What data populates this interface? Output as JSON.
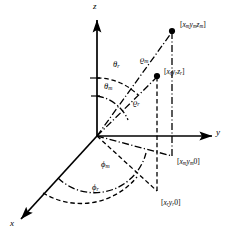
{
  "figure": {
    "background_color": "#ffffff",
    "stroke_color": "#000000"
  },
  "axes": [
    {
      "name": "z-axis",
      "label": "z",
      "direction": "up"
    },
    {
      "name": "y-axis",
      "label": "y",
      "direction": "right"
    },
    {
      "name": "x-axis",
      "label": "x",
      "direction": "down-left"
    }
  ],
  "axis_labels": {
    "z": "z",
    "y": "y",
    "x": "x"
  },
  "points": [
    {
      "id": "point-m",
      "label_prefix": "[",
      "label": "[xₘyₘzₘ]",
      "coords": [
        "x",
        "y",
        "z"
      ],
      "subscript": "m"
    },
    {
      "id": "point-r",
      "label": "[xᵣyᵣzᵣ]",
      "coords": [
        "x",
        "y",
        "z"
      ],
      "subscript": "r"
    },
    {
      "id": "projection-m",
      "label": "[xₘyₘ 0]",
      "coords": [
        "x",
        "y",
        "0"
      ],
      "subscript": "m"
    },
    {
      "id": "projection-r",
      "label": "[xᵣyᵣ 0]",
      "coords": [
        "x",
        "y",
        "0"
      ],
      "subscript": "r"
    }
  ],
  "angles": [
    {
      "id": "theta-r",
      "symbol": "θ",
      "subscript": "r",
      "label": "θr",
      "from_axis": "z"
    },
    {
      "id": "theta-m",
      "symbol": "θ",
      "subscript": "m",
      "label": "θm",
      "from_axis": "z"
    },
    {
      "id": "phi-m",
      "symbol": "ϕ",
      "subscript": "m",
      "label": "ϕm",
      "from_axis": "x"
    },
    {
      "id": "phi-r",
      "symbol": "ϕ",
      "subscript": "r",
      "label": "ϕr",
      "from_axis": "x"
    }
  ],
  "radii": [
    {
      "id": "rho-m",
      "symbol": "ϱ",
      "subscript": "m",
      "label": "ϱm",
      "line_style": "dash-dot"
    },
    {
      "id": "rho-r",
      "symbol": "ϱ",
      "subscript": "r",
      "label": "ϱr",
      "line_style": "dashed"
    }
  ],
  "greek": {
    "theta": "θ",
    "phi": "ϕ",
    "rho": "ϱ"
  },
  "subscripts": {
    "m": "m",
    "r": "r"
  },
  "brackets": {
    "open": "[",
    "close": "]",
    "zero": "0"
  },
  "coord_names": {
    "x": "x",
    "y": "y",
    "z": "z"
  }
}
